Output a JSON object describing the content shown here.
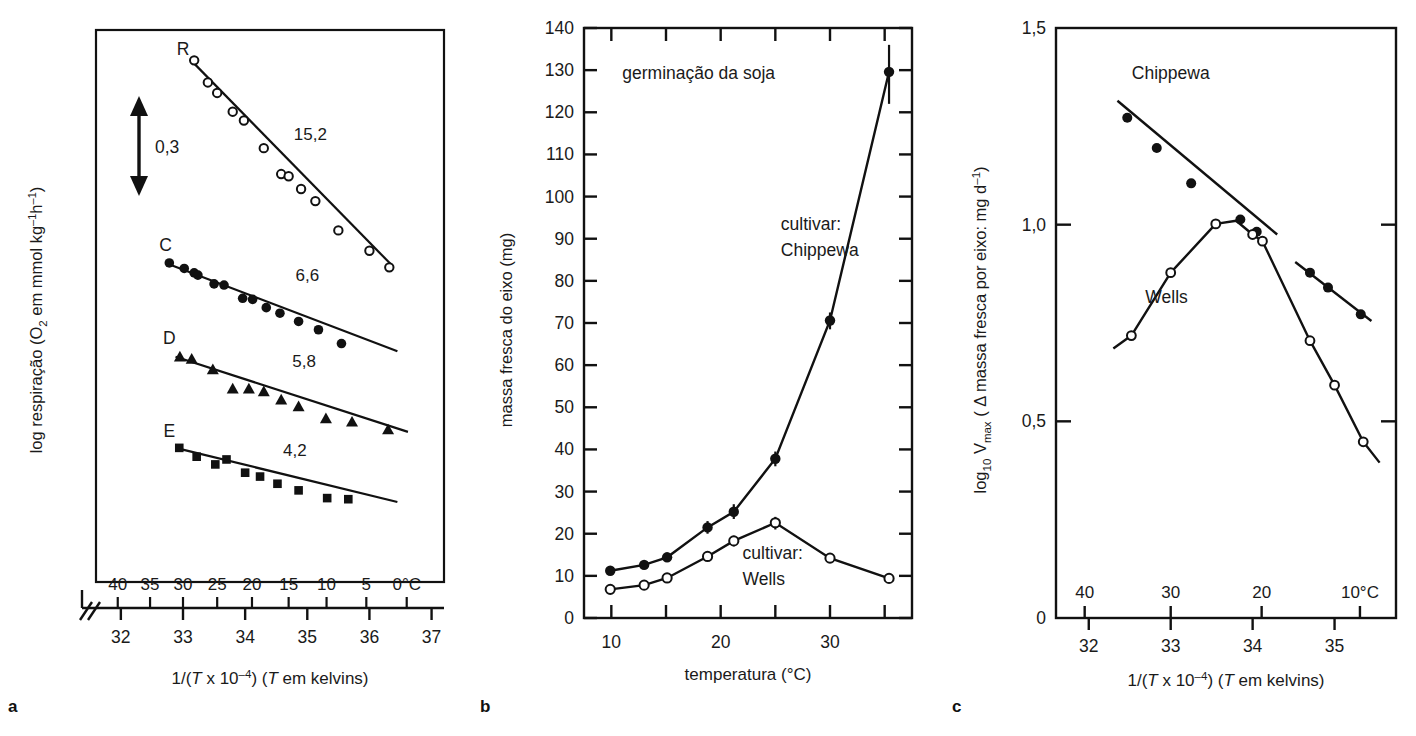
{
  "figure": {
    "panel_letters": [
      "a",
      "b",
      "c"
    ]
  },
  "panel_a": {
    "letter": "a",
    "ylabel": {
      "pre": "log respiração (O",
      "sub": "2",
      "mid": " em mmol kg",
      "sup1": "–1",
      "mid2": "h",
      "sup2": "–1",
      "post": ")"
    },
    "xlabel": {
      "pre": "1/(",
      "italic1": "T",
      "mid": " x 10",
      "sup": "–4",
      "mid2": ") (",
      "italic2": "T",
      "post": " em kelvins)"
    },
    "scalebar_label": "0,3",
    "celsius_ticks": [
      "40",
      "35",
      "30",
      "25",
      "20",
      "15",
      "10",
      "5",
      "0°C"
    ],
    "invT_ticks": [
      "32",
      "33",
      "34",
      "35",
      "36",
      "37"
    ],
    "series_labels": [
      "R",
      "C",
      "D",
      "E"
    ],
    "series_values": [
      "15,2",
      "6,6",
      "5,8",
      "4,2"
    ],
    "chart_data": {
      "type": "scatter",
      "title": "",
      "xlabel": "1/(T x 10^-4) (T em kelvins)",
      "ylabel": "log respiração (O2 em mmol kg^-1 h^-1)",
      "xlim": [
        31.6,
        37.2
      ],
      "ylim": [
        0.0,
        1.0
      ],
      "grid": false,
      "legend": "inline-labels",
      "secondary_xaxis": {
        "label": "°C",
        "ticks": [
          {
            "celsius": "40",
            "invT": 31.95
          },
          {
            "celsius": "35",
            "invT": 32.47
          },
          {
            "celsius": "30",
            "invT": 33.0
          },
          {
            "celsius": "25",
            "invT": 33.55
          },
          {
            "celsius": "20",
            "invT": 34.11
          },
          {
            "celsius": "15",
            "invT": 34.7
          },
          {
            "celsius": "10",
            "invT": 35.31
          },
          {
            "celsius": "5",
            "invT": 35.95
          },
          {
            "celsius": "0°C",
            "invT": 36.6
          }
        ]
      },
      "axis_break": true,
      "series": [
        {
          "name": "R",
          "marker": "open-circle",
          "slope_label": "15,2",
          "label_x": 33.0,
          "label_y": 0.955,
          "value_label_x": 35.05,
          "value_label_y": 0.8,
          "fit_line": {
            "x": [
              33.13,
              36.35
            ],
            "y": [
              0.945,
              0.575
            ]
          },
          "points": [
            {
              "x": 33.18,
              "y": 0.945
            },
            {
              "x": 33.4,
              "y": 0.905
            },
            {
              "x": 33.55,
              "y": 0.886
            },
            {
              "x": 33.8,
              "y": 0.852
            },
            {
              "x": 33.98,
              "y": 0.836
            },
            {
              "x": 34.3,
              "y": 0.786
            },
            {
              "x": 34.58,
              "y": 0.739
            },
            {
              "x": 34.7,
              "y": 0.735
            },
            {
              "x": 34.9,
              "y": 0.712
            },
            {
              "x": 35.13,
              "y": 0.69
            },
            {
              "x": 35.5,
              "y": 0.637
            },
            {
              "x": 36.0,
              "y": 0.6
            },
            {
              "x": 36.32,
              "y": 0.57
            }
          ]
        },
        {
          "name": "C",
          "marker": "filled-circle",
          "slope_label": "6,6",
          "label_x": 32.72,
          "label_y": 0.6,
          "value_label_x": 35.0,
          "value_label_y": 0.545,
          "fit_line": {
            "x": [
              32.72,
              36.45
            ],
            "y": [
              0.578,
              0.418
            ]
          },
          "points": [
            {
              "x": 32.78,
              "y": 0.578
            },
            {
              "x": 33.02,
              "y": 0.568
            },
            {
              "x": 33.18,
              "y": 0.56
            },
            {
              "x": 33.24,
              "y": 0.556
            },
            {
              "x": 33.5,
              "y": 0.54
            },
            {
              "x": 33.66,
              "y": 0.538
            },
            {
              "x": 33.96,
              "y": 0.514
            },
            {
              "x": 34.12,
              "y": 0.512
            },
            {
              "x": 34.34,
              "y": 0.497
            },
            {
              "x": 34.56,
              "y": 0.487
            },
            {
              "x": 34.86,
              "y": 0.472
            },
            {
              "x": 35.18,
              "y": 0.457
            },
            {
              "x": 35.55,
              "y": 0.432
            }
          ]
        },
        {
          "name": "D",
          "marker": "filled-triangle",
          "slope_label": "5,8",
          "label_x": 32.78,
          "label_y": 0.432,
          "value_label_x": 34.95,
          "value_label_y": 0.39,
          "fit_line": {
            "x": [
              32.88,
              36.62
            ],
            "y": [
              0.408,
              0.272
            ]
          },
          "points": [
            {
              "x": 32.95,
              "y": 0.408
            },
            {
              "x": 33.14,
              "y": 0.404
            },
            {
              "x": 33.48,
              "y": 0.385
            },
            {
              "x": 33.8,
              "y": 0.35
            },
            {
              "x": 34.06,
              "y": 0.35
            },
            {
              "x": 34.3,
              "y": 0.345
            },
            {
              "x": 34.58,
              "y": 0.33
            },
            {
              "x": 34.86,
              "y": 0.318
            },
            {
              "x": 35.3,
              "y": 0.296
            },
            {
              "x": 35.72,
              "y": 0.29
            },
            {
              "x": 36.3,
              "y": 0.276
            }
          ]
        },
        {
          "name": "E",
          "marker": "filled-square",
          "slope_label": "4,2",
          "label_x": 32.78,
          "label_y": 0.262,
          "value_label_x": 34.8,
          "value_label_y": 0.228,
          "fit_line": {
            "x": [
              32.88,
              36.45
            ],
            "y": [
              0.243,
              0.145
            ]
          },
          "points": [
            {
              "x": 32.94,
              "y": 0.243
            },
            {
              "x": 33.22,
              "y": 0.227
            },
            {
              "x": 33.52,
              "y": 0.213
            },
            {
              "x": 33.7,
              "y": 0.222
            },
            {
              "x": 34.0,
              "y": 0.198
            },
            {
              "x": 34.24,
              "y": 0.191
            },
            {
              "x": 34.52,
              "y": 0.178
            },
            {
              "x": 34.86,
              "y": 0.166
            },
            {
              "x": 35.32,
              "y": 0.152
            },
            {
              "x": 35.66,
              "y": 0.15
            }
          ]
        }
      ]
    }
  },
  "panel_b": {
    "letter": "b",
    "title": "germinação da soja",
    "ylabel": "massa fresca do eixo (mg)",
    "xlabel": "temperatura (°C)",
    "ytick_labels": [
      "0",
      "10",
      "20",
      "30",
      "40",
      "50",
      "60",
      "70",
      "80",
      "90",
      "100",
      "110",
      "120",
      "130",
      "140"
    ],
    "xtick_labels": [
      "10",
      "20",
      "30"
    ],
    "annotation_chippewa": [
      "cultivar:",
      "Chippewa"
    ],
    "annotation_wells": [
      "cultivar:",
      "Wells"
    ],
    "chart_data": {
      "type": "line",
      "title": "germinação da soja",
      "xlabel": "temperatura (°C)",
      "ylabel": "massa fresca do eixo (mg)",
      "xlim": [
        7.5,
        37.5
      ],
      "ylim": [
        0,
        140
      ],
      "ytick_step": 10,
      "xtick_step": 5,
      "grid": false,
      "legend": "inline-labels",
      "series": [
        {
          "name": "Chippewa",
          "marker": "filled-circle",
          "label_x": 25.5,
          "label_y": 92,
          "x": [
            9.9,
            13.0,
            15.1,
            18.8,
            21.2,
            25.0,
            30.0,
            35.4
          ],
          "y": [
            11.2,
            12.6,
            14.4,
            21.5,
            25.2,
            37.8,
            70.6,
            129.6
          ],
          "errorbars": [
            {
              "x": 18.8,
              "lo": 20.0,
              "hi": 23.0
            },
            {
              "x": 21.2,
              "lo": 23.5,
              "hi": 27.0
            },
            {
              "x": 25.0,
              "lo": 36.0,
              "hi": 39.5
            },
            {
              "x": 30.0,
              "lo": 68.5,
              "hi": 72.5
            },
            {
              "x": 35.4,
              "lo": 122.0,
              "hi": 136.0
            }
          ]
        },
        {
          "name": "Wells",
          "marker": "open-circle",
          "label_x": 22.0,
          "label_y": 14,
          "x": [
            9.9,
            13.0,
            15.1,
            18.8,
            21.2,
            25.0,
            30.0,
            35.4
          ],
          "y": [
            6.8,
            7.8,
            9.5,
            14.6,
            18.3,
            22.6,
            14.2,
            9.4
          ],
          "errorbars": [
            {
              "x": 21.2,
              "lo": 17.0,
              "hi": 19.5
            },
            {
              "x": 25.0,
              "lo": 21.0,
              "hi": 24.0
            }
          ]
        }
      ]
    }
  },
  "panel_c": {
    "letter": "c",
    "ylabel": {
      "pre": "log",
      "sub1": "10",
      "mid": " V",
      "sub2": "max",
      "mid2": " ( Δ massa fresca por eixo: mg d",
      "sup": "–1",
      "post": ")"
    },
    "xlabel": {
      "pre": "1/(",
      "italic1": "T",
      "mid": " x 10",
      "sup": "–4",
      "mid2": ") (",
      "italic2": "T",
      "post": " em kelvins)"
    },
    "ytick_labels": [
      "0",
      "0,5",
      "1,0",
      "1,5"
    ],
    "celsius_ticks": [
      "40",
      "30",
      "20",
      "10°C"
    ],
    "invT_ticks": [
      "32",
      "33",
      "34",
      "35"
    ],
    "series_labels": [
      "Chippewa",
      "Wells"
    ],
    "chart_data": {
      "type": "line",
      "title": "",
      "xlabel": "1/(T x 10^-4) (T em kelvins)",
      "ylabel": "log10 Vmax ( Δ massa fresca por eixo: mg d^-1)",
      "xlim": [
        31.6,
        35.75
      ],
      "ylim": [
        0,
        1.5
      ],
      "ytick_values": [
        0,
        0.5,
        1.0,
        1.5
      ],
      "grid": false,
      "legend": "inline-labels",
      "secondary_xaxis": {
        "label": "°C",
        "ticks": [
          {
            "celsius": "40",
            "invT": 31.95
          },
          {
            "celsius": "30",
            "invT": 33.0
          },
          {
            "celsius": "20",
            "invT": 34.11
          },
          {
            "celsius": "10°C",
            "invT": 35.31
          }
        ]
      },
      "series": [
        {
          "name": "Chippewa",
          "marker": "filled-circle",
          "label_x": 33.0,
          "label_y": 1.37,
          "segments": [
            {
              "line_x": [
                32.35,
                34.3
              ],
              "line_y": [
                1.315,
                0.975
              ]
            },
            {
              "line_x": [
                34.52,
                35.45
              ],
              "line_y": [
                0.905,
                0.755
              ]
            }
          ],
          "points": [
            {
              "x": 32.47,
              "y": 1.272
            },
            {
              "x": 32.83,
              "y": 1.195
            },
            {
              "x": 33.25,
              "y": 1.105
            },
            {
              "x": 33.85,
              "y": 1.013
            },
            {
              "x": 34.05,
              "y": 0.982
            },
            {
              "x": 34.7,
              "y": 0.878
            },
            {
              "x": 34.92,
              "y": 0.84
            },
            {
              "x": 35.32,
              "y": 0.772
            }
          ]
        },
        {
          "name": "Wells",
          "marker": "open-circle",
          "label_x": 32.95,
          "label_y": 0.8,
          "curve": {
            "x": [
              32.3,
              32.52,
              33.0,
              33.55,
              33.8,
              34.0,
              34.12,
              34.7,
              35.0,
              35.35,
              35.55
            ],
            "y": [
              0.685,
              0.718,
              0.878,
              1.002,
              1.01,
              0.975,
              0.958,
              0.705,
              0.592,
              0.448,
              0.395
            ]
          },
          "points": [
            {
              "x": 32.52,
              "y": 0.718
            },
            {
              "x": 33.0,
              "y": 0.878
            },
            {
              "x": 33.55,
              "y": 1.002
            },
            {
              "x": 34.0,
              "y": 0.975
            },
            {
              "x": 34.12,
              "y": 0.958
            },
            {
              "x": 34.7,
              "y": 0.705
            },
            {
              "x": 35.0,
              "y": 0.592
            },
            {
              "x": 35.35,
              "y": 0.448
            }
          ]
        }
      ]
    }
  }
}
